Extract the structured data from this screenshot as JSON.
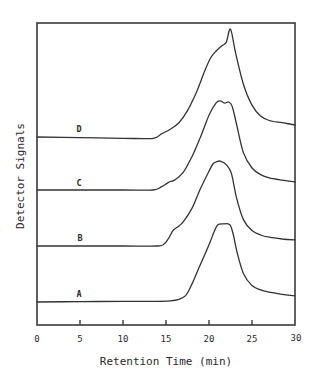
{
  "chart_data": {
    "type": "line",
    "title": "",
    "xlabel": "Retention Time (min)",
    "ylabel": "Detector Signals",
    "xlim": [
      0,
      30
    ],
    "xticks": [
      0,
      5,
      10,
      15,
      20,
      25,
      30
    ],
    "xtick_labels": [
      "0",
      "5",
      "10",
      "15",
      "20",
      "25",
      "30"
    ],
    "yticks": [],
    "grid": false,
    "legend": "inline labels on curves",
    "y_units": "arbitrary (stacked, offset traces)",
    "series": [
      {
        "name": "A",
        "label_pos": [
          5,
          0.1
        ],
        "offset": 0,
        "x": [
          0,
          5,
          10,
          14,
          15.5,
          16.5,
          17.3,
          18,
          19,
          20,
          20.6,
          21,
          21.6,
          22.4,
          22.8,
          23.3,
          24,
          25,
          26,
          27,
          28.5,
          30
        ],
        "y": [
          0,
          0.2,
          0.3,
          0.3,
          0.5,
          1.2,
          3,
          8,
          17,
          26,
          32,
          35,
          35.5,
          35.2,
          31,
          22,
          13,
          7.5,
          5.5,
          4.5,
          3.5,
          2.8
        ]
      },
      {
        "name": "B",
        "label_pos": [
          5,
          0.1
        ],
        "offset": 0,
        "x": [
          0,
          5,
          10,
          14,
          14.8,
          15.3,
          15.8,
          16.3,
          17,
          18,
          19,
          20,
          20.5,
          21,
          21.4,
          22,
          22.6,
          23.2,
          24,
          25,
          26,
          27,
          28.5,
          30
        ],
        "y": [
          0,
          0,
          0,
          0,
          1,
          3.5,
          7,
          8.5,
          11,
          17,
          26,
          34,
          37.5,
          38.5,
          38.5,
          37,
          33,
          22,
          12,
          7,
          5,
          4,
          3.2,
          2.8
        ]
      },
      {
        "name": "C",
        "label_pos": [
          5,
          0.1
        ],
        "offset": 0,
        "x": [
          0,
          5,
          10,
          13.5,
          14.5,
          15.3,
          16,
          17,
          18,
          19,
          20,
          20.8,
          21.3,
          21.8,
          22.3,
          22.7,
          23.2,
          24,
          25,
          26,
          27,
          28.5,
          30
        ],
        "y": [
          0,
          0,
          0,
          0,
          1.5,
          3.5,
          4.5,
          8,
          15,
          24,
          34,
          39.5,
          40.5,
          39.5,
          40,
          38,
          30,
          17,
          10,
          7,
          5.5,
          4.5,
          3.7
        ]
      },
      {
        "name": "D",
        "label_pos": [
          5,
          0.1
        ],
        "offset": 0,
        "x": [
          0,
          5,
          10,
          13.5,
          14.5,
          15.5,
          16.5,
          17.5,
          18.5,
          19.5,
          20.2,
          20.8,
          21.5,
          22,
          22.5,
          23.1,
          24,
          25,
          26,
          27,
          28.5,
          30
        ],
        "y": [
          0,
          -0.3,
          -0.6,
          -0.6,
          1.5,
          3.5,
          6.5,
          12,
          20,
          30,
          36,
          39,
          41.5,
          43,
          49,
          38,
          24,
          14.5,
          9.5,
          7.5,
          6.5,
          5.5
        ]
      }
    ]
  },
  "plot": {
    "px_left": 37,
    "px_right": 295,
    "px_top": 23,
    "px_bottom": 325,
    "tick_len": 5,
    "baselines_px": {
      "A": 302,
      "B": 246,
      "C": 190,
      "D": 137
    },
    "px_per_unit_y": 2.2,
    "label_px": {
      "A": [
        79,
        297
      ],
      "B": [
        80,
        241
      ],
      "C": [
        79,
        186
      ],
      "D": [
        79,
        132
      ]
    }
  },
  "labels": {
    "xlabel": "Retention Time (min)",
    "ylabel": "Detector Signals",
    "series_A": "A",
    "series_B": "B",
    "series_C": "C",
    "series_D": "D",
    "tick_0": "0",
    "tick_5": "5",
    "tick_10": "10",
    "tick_15": "15",
    "tick_20": "20",
    "tick_25": "25",
    "tick_30": "30"
  }
}
